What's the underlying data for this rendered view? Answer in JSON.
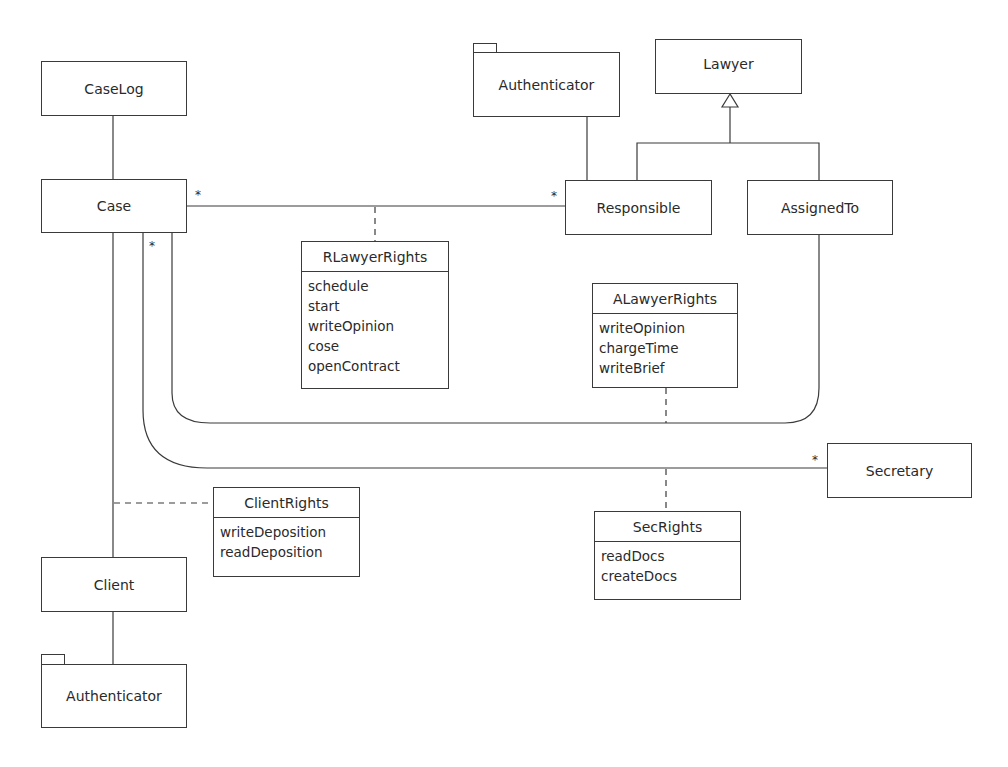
{
  "diagram": {
    "type": "UML class diagram",
    "classes": {
      "caselog": "CaseLog",
      "case": "Case",
      "authenticator_top": "Authenticator",
      "lawyer": "Lawyer",
      "responsible": "Responsible",
      "assignedto": "AssignedTo",
      "secretary": "Secretary",
      "client": "Client",
      "authenticator_bottom": "Authenticator"
    },
    "association_classes": {
      "rlawyerrights": {
        "name": "RLawyerRights",
        "operations": [
          "schedule",
          "start",
          "writeOpinion",
          "cose",
          "openContract"
        ]
      },
      "alawyerrights": {
        "name": "ALawyerRights",
        "operations": [
          "writeOpinion",
          "chargeTime",
          "writeBrief"
        ]
      },
      "clientrights": {
        "name": "ClientRights",
        "operations": [
          "writeDeposition",
          "readDeposition"
        ]
      },
      "secrights": {
        "name": "SecRights",
        "operations": [
          "readDocs",
          "createDocs"
        ]
      }
    },
    "multiplicities": {
      "case_responsible_case_end": "*",
      "case_responsible_responsible_end": "*",
      "case_assigned_case_end": "*",
      "case_secretary_secretary_end": "*"
    },
    "relationships": [
      {
        "from": "CaseLog",
        "to": "Case",
        "kind": "association"
      },
      {
        "from": "Case",
        "to": "Responsible",
        "kind": "association",
        "association_class": "RLawyerRights"
      },
      {
        "from": "Case",
        "to": "AssignedTo",
        "kind": "association",
        "association_class": "ALawyerRights"
      },
      {
        "from": "Case",
        "to": "Secretary",
        "kind": "association",
        "association_class": "SecRights"
      },
      {
        "from": "Case",
        "to": "Client",
        "kind": "association",
        "association_class": "ClientRights"
      },
      {
        "from": "Client",
        "to": "Authenticator",
        "kind": "association"
      },
      {
        "from": "Responsible",
        "to": "Authenticator",
        "kind": "association"
      },
      {
        "from": "Responsible",
        "to": "Lawyer",
        "kind": "generalization"
      },
      {
        "from": "AssignedTo",
        "to": "Lawyer",
        "kind": "generalization"
      }
    ]
  }
}
